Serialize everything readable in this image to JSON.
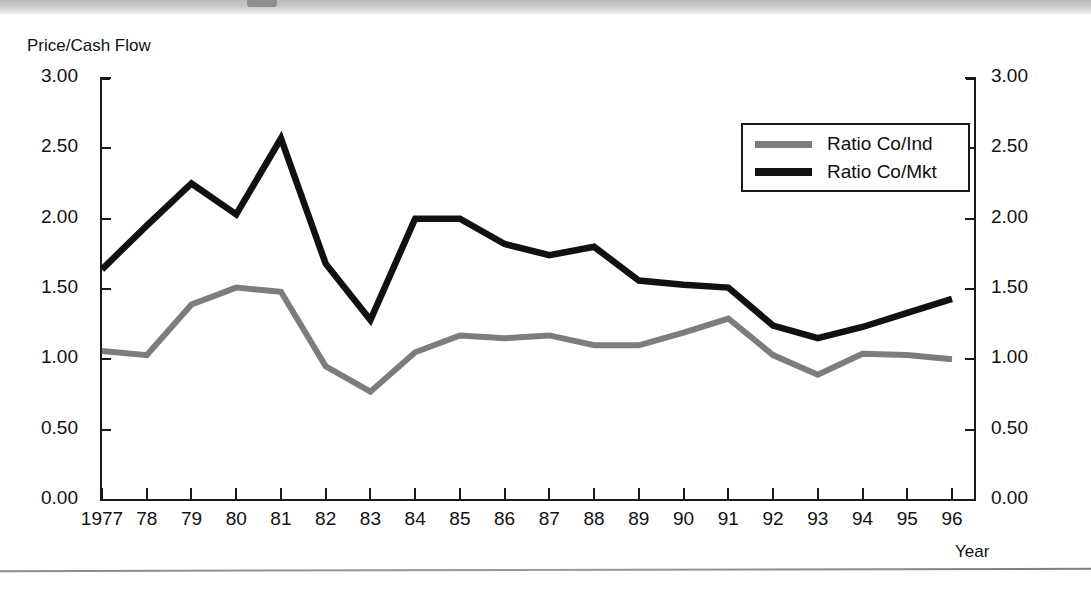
{
  "chart_data": {
    "type": "line",
    "title": "",
    "xlabel": "Year",
    "ylabel": "Price/Cash Flow",
    "ylim": [
      0,
      3
    ],
    "y_ticks": [
      "0.00",
      "0.50",
      "1.00",
      "1.50",
      "2.00",
      "2.50",
      "3.00"
    ],
    "y_tick_values": [
      0,
      0.5,
      1.0,
      1.5,
      2.0,
      2.5,
      3.0
    ],
    "dual_axis": true,
    "grid": false,
    "legend_position": "upper-right",
    "categories": [
      "1977",
      "78",
      "79",
      "80",
      "81",
      "82",
      "83",
      "84",
      "85",
      "86",
      "87",
      "88",
      "89",
      "90",
      "91",
      "92",
      "93",
      "94",
      "95",
      "96"
    ],
    "x": [
      1977,
      1978,
      1979,
      1980,
      1981,
      1982,
      1983,
      1984,
      1985,
      1986,
      1987,
      1988,
      1989,
      1990,
      1991,
      1992,
      1993,
      1994,
      1995,
      1996
    ],
    "series": [
      {
        "name": "Ratio Co/Ind",
        "color": "#7d7d7d",
        "values": [
          1.06,
          1.03,
          1.39,
          1.51,
          1.48,
          0.95,
          0.77,
          1.05,
          1.17,
          1.15,
          1.17,
          1.1,
          1.1,
          1.19,
          1.29,
          1.03,
          0.89,
          1.04,
          1.03,
          1.0
        ]
      },
      {
        "name": "Ratio Co/Mkt",
        "color": "#111111",
        "values": [
          1.64,
          1.95,
          2.25,
          2.03,
          2.57,
          1.68,
          1.28,
          2.0,
          2.0,
          1.82,
          1.74,
          1.8,
          1.56,
          1.53,
          1.51,
          1.24,
          1.15,
          1.23,
          1.33,
          1.43
        ]
      }
    ]
  },
  "axes": {
    "y_label": "Price/Cash Flow",
    "x_label": "Year"
  },
  "legend": {
    "items": [
      {
        "label": "Ratio Co/Ind",
        "color": "#7d7d7d"
      },
      {
        "label": "Ratio Co/Mkt",
        "color": "#111111"
      }
    ]
  }
}
